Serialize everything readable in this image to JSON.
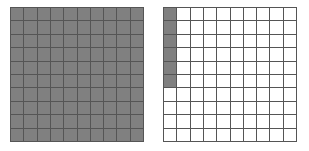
{
  "figure": {
    "name": "hundredths-grids",
    "colors": {
      "shaded": "#808080",
      "unshaded": "#ffffff",
      "gridline": "#555555",
      "background": "#ffffff"
    }
  },
  "chart_data": {
    "type": "heatmap",
    "title": "",
    "subtitle": "",
    "xlabel": "",
    "ylabel": "",
    "grid": true,
    "legend_position": "none",
    "grids": [
      {
        "label": "grid-left",
        "rows": 10,
        "columns": 10,
        "total_cells": 100,
        "shaded_cells": 100,
        "unshaded_cells": 0,
        "fraction_shaded": "100/100",
        "decimal_value": 1.0,
        "percent_shaded": 100,
        "fill_order": "all-cells",
        "cells": [
          [
            1,
            1,
            1,
            1,
            1,
            1,
            1,
            1,
            1,
            1
          ],
          [
            1,
            1,
            1,
            1,
            1,
            1,
            1,
            1,
            1,
            1
          ],
          [
            1,
            1,
            1,
            1,
            1,
            1,
            1,
            1,
            1,
            1
          ],
          [
            1,
            1,
            1,
            1,
            1,
            1,
            1,
            1,
            1,
            1
          ],
          [
            1,
            1,
            1,
            1,
            1,
            1,
            1,
            1,
            1,
            1
          ],
          [
            1,
            1,
            1,
            1,
            1,
            1,
            1,
            1,
            1,
            1
          ],
          [
            1,
            1,
            1,
            1,
            1,
            1,
            1,
            1,
            1,
            1
          ],
          [
            1,
            1,
            1,
            1,
            1,
            1,
            1,
            1,
            1,
            1
          ],
          [
            1,
            1,
            1,
            1,
            1,
            1,
            1,
            1,
            1,
            1
          ],
          [
            1,
            1,
            1,
            1,
            1,
            1,
            1,
            1,
            1,
            1
          ]
        ]
      },
      {
        "label": "grid-right",
        "rows": 10,
        "columns": 10,
        "total_cells": 100,
        "shaded_cells": 6,
        "unshaded_cells": 94,
        "fraction_shaded": "6/100",
        "decimal_value": 0.06,
        "percent_shaded": 6,
        "fill_order": "first-column-top-down",
        "cells": [
          [
            1,
            0,
            0,
            0,
            0,
            0,
            0,
            0,
            0,
            0
          ],
          [
            1,
            0,
            0,
            0,
            0,
            0,
            0,
            0,
            0,
            0
          ],
          [
            1,
            0,
            0,
            0,
            0,
            0,
            0,
            0,
            0,
            0
          ],
          [
            1,
            0,
            0,
            0,
            0,
            0,
            0,
            0,
            0,
            0
          ],
          [
            1,
            0,
            0,
            0,
            0,
            0,
            0,
            0,
            0,
            0
          ],
          [
            1,
            0,
            0,
            0,
            0,
            0,
            0,
            0,
            0,
            0
          ],
          [
            0,
            0,
            0,
            0,
            0,
            0,
            0,
            0,
            0,
            0
          ],
          [
            0,
            0,
            0,
            0,
            0,
            0,
            0,
            0,
            0,
            0
          ],
          [
            0,
            0,
            0,
            0,
            0,
            0,
            0,
            0,
            0,
            0
          ],
          [
            0,
            0,
            0,
            0,
            0,
            0,
            0,
            0,
            0,
            0
          ]
        ]
      }
    ],
    "combined": {
      "total_shaded_cells": 106,
      "total_cells": 200,
      "decimal_value": 1.06,
      "percent": 106,
      "mixed_number": "1 6/100"
    }
  }
}
